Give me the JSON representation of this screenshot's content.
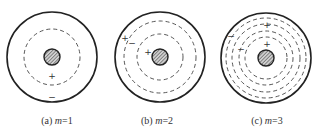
{
  "figure": {
    "colors": {
      "stroke": "#222222",
      "dashed": "#444444",
      "core_fill": "#888888",
      "text": "#333333"
    },
    "panels": [
      {
        "id": "a",
        "caption_prefix": "(a) ",
        "caption_var": "m",
        "caption_value": "=1",
        "center": [
          52,
          57
        ],
        "outer_radius": 45,
        "core_radius": 8,
        "dashed_radii": [
          28
        ],
        "signs": [
          {
            "symbol": "+",
            "x": 52,
            "y": 79
          },
          {
            "symbol": "−",
            "x": 52,
            "y": 100
          }
        ]
      },
      {
        "id": "b",
        "caption_prefix": "(b) ",
        "caption_var": "m",
        "caption_value": "=2",
        "center": [
          160,
          57
        ],
        "outer_radius": 45,
        "core_radius": 8,
        "dashed_radii": [
          36,
          23
        ],
        "signs": [
          {
            "symbol": "+",
            "x": 125,
            "y": 41
          },
          {
            "symbol": "−",
            "x": 132,
            "y": 46
          },
          {
            "symbol": "+",
            "x": 148,
            "y": 55
          }
        ]
      },
      {
        "id": "c",
        "caption_prefix": "(c) ",
        "caption_var": "m",
        "caption_value": "=3",
        "center": [
          266,
          58
        ],
        "outer_radius": 45,
        "core_radius": 8,
        "dashed_radii": [
          40,
          34,
          27,
          21
        ],
        "signs": [
          {
            "symbol": "+",
            "x": 267,
            "y": 28
          },
          {
            "symbol": "+",
            "x": 267,
            "y": 47
          },
          {
            "symbol": "−",
            "x": 231,
            "y": 39
          },
          {
            "symbol": "−",
            "x": 241,
            "y": 52
          }
        ]
      }
    ]
  },
  "captions": {
    "a": {
      "prefix": "(a) ",
      "var": "m",
      "value": "=1"
    },
    "b": {
      "prefix": "(b) ",
      "var": "m",
      "value": "=2"
    },
    "c": {
      "prefix": "(c) ",
      "var": "m",
      "value": "=3"
    }
  }
}
